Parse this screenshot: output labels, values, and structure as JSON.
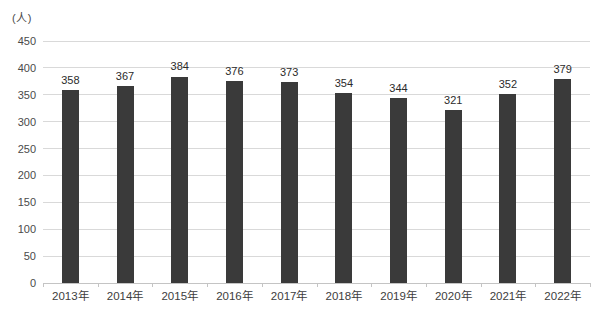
{
  "chart_data": {
    "type": "bar",
    "title": "",
    "xlabel": "",
    "ylabel": "(人)",
    "categories": [
      "2013年",
      "2014年",
      "2015年",
      "2016年",
      "2017年",
      "2018年",
      "2019年",
      "2020年",
      "2021年",
      "2022年"
    ],
    "values": [
      358,
      367,
      384,
      376,
      373,
      354,
      344,
      321,
      352,
      379
    ],
    "ylim": [
      0,
      450
    ],
    "yticks": [
      0,
      50,
      100,
      150,
      200,
      250,
      300,
      350,
      400,
      450
    ],
    "grid": true,
    "legend": "none",
    "colors": {
      "bar": "#3a3a3a",
      "gridline": "#d9d9d9",
      "axis_line": "#c4c4c4",
      "tick_text": "#4a4a4a",
      "value_text": "#2b2b2b",
      "background": "#ffffff"
    }
  }
}
